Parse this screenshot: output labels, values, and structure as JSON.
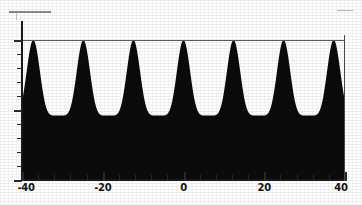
{
  "figure": {
    "background_color": "#fdfdfd",
    "fill_color": "#0b0b0b",
    "axis_color": "#1a1a1a",
    "envelope_color": "#5b5b5b"
  },
  "marks": {
    "top_rule_left": "",
    "top_rule_right": "",
    "top_tick_left": ""
  },
  "chart_data": {
    "type": "area",
    "title": "",
    "subtitle": "",
    "xlabel": "",
    "ylabel": "",
    "xlim": [
      -40,
      40
    ],
    "ylim": [
      0,
      1
    ],
    "grid": false,
    "legend": null,
    "annotations": [
      {
        "kind": "horizontal-line",
        "y": 1.0,
        "note": "envelope line across the tops of all peaks"
      }
    ],
    "xticks": [
      -40,
      -20,
      0,
      20,
      40
    ],
    "xticklabels": [
      "-40",
      "-20",
      "0",
      "20",
      "40"
    ],
    "xminor_tick_step": 4,
    "yticks": [
      0,
      0.1,
      0.2,
      0.3,
      0.4,
      0.5,
      0.6,
      0.7,
      0.8,
      0.9,
      1.0
    ],
    "yticklabels": [
      "",
      "",
      "",
      "",
      "",
      "",
      "",
      "",
      "",
      "",
      ""
    ],
    "series": [
      {
        "name": "oscillation",
        "description": "periodic peaked oscillation, filled solid black below the curve",
        "period": 12.4,
        "peak_value": 1.0,
        "trough_value": 0.46,
        "peak_x": [
          -37.3,
          -24.9,
          -12.4,
          0.0,
          12.4,
          24.9,
          37.3
        ],
        "trough_x": [
          -31.1,
          -18.7,
          -6.2,
          6.2,
          18.7,
          31.1
        ],
        "peak_count": 7,
        "trough_count": 6,
        "shape": "cos^6-like narrow peaks on a raised baseline"
      }
    ]
  }
}
